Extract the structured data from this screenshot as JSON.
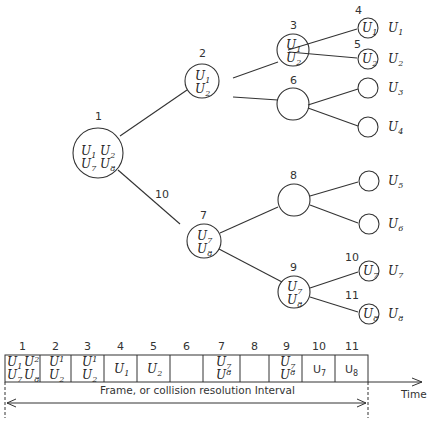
{
  "diagram": {
    "nodes": [
      {
        "id": 1,
        "label": "1",
        "contents": [
          "U1 U2",
          "U7 U8"
        ]
      },
      {
        "id": 2,
        "label": "2",
        "contents": [
          "U1",
          "U2"
        ]
      },
      {
        "id": 3,
        "label": "3",
        "contents": [
          "U1",
          "U2"
        ]
      },
      {
        "id": 4,
        "label": "4",
        "contents": [
          "U1"
        ]
      },
      {
        "id": 5,
        "label": "5",
        "contents": [
          "U2"
        ]
      },
      {
        "id": 6,
        "label": "6",
        "contents": []
      },
      {
        "id": 7,
        "label": "7",
        "contents": [
          "U7",
          "U8"
        ]
      },
      {
        "id": 8,
        "label": "8",
        "contents": []
      },
      {
        "id": 9,
        "label": "9",
        "contents": [
          "U7",
          "U8"
        ]
      },
      {
        "id": 10,
        "label": "10",
        "contents": [
          "U7"
        ]
      },
      {
        "id": 11,
        "label": "11",
        "contents": [
          "U8"
        ]
      }
    ],
    "edge_label_10": "10",
    "leaf_users": [
      "U1",
      "U2",
      "U3",
      "U4",
      "U5",
      "U6",
      "U7",
      "U8"
    ],
    "timeline": {
      "slots": [
        "1",
        "2",
        "3",
        "4",
        "5",
        "6",
        "7",
        "8",
        "9",
        "10",
        "11"
      ],
      "frame_label": "Frame, or collision resolution Interval",
      "time_label": "Time"
    }
  }
}
